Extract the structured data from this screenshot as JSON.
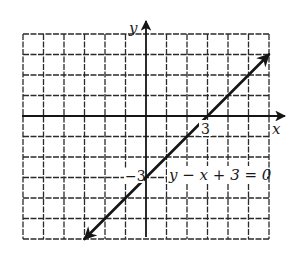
{
  "chart_data": {
    "type": "line",
    "title": "",
    "equation_label": "y − x + 3 = 0",
    "equation": "y = x - 3",
    "xlabel": "x",
    "ylabel": "y",
    "xlim": [
      -6,
      6
    ],
    "ylim": [
      -6,
      4
    ],
    "grid": true,
    "grid_spacing": 1,
    "series": [
      {
        "name": "y − x + 3 = 0",
        "x": [
          -3,
          0,
          3,
          6
        ],
        "y": [
          -6,
          -3,
          0,
          3
        ],
        "arrows_both_ends": true
      }
    ],
    "annotations": [
      {
        "text": "3",
        "at": [
          3,
          0
        ],
        "meaning": "x-intercept"
      },
      {
        "text": "−3",
        "at": [
          0,
          -3
        ],
        "meaning": "y-intercept"
      }
    ]
  },
  "labels": {
    "x_axis": "x",
    "y_axis": "y",
    "x_intercept": "3",
    "y_intercept": "−3",
    "equation": "y − x + 3 = 0"
  },
  "colors": {
    "ink": "#151515",
    "grid": "#2a2a2a",
    "background": "#ffffff"
  }
}
